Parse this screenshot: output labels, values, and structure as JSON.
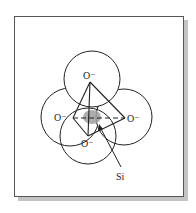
{
  "figure": {
    "frame": {
      "x": 14,
      "y": 16,
      "width": 169,
      "height": 180,
      "shadow_color": "#c4c4c4",
      "border_color": "#555555"
    },
    "atom_color": "#9e9e9e",
    "line_color": "#222222",
    "oxygen_atoms": [
      {
        "id": "top",
        "label": "O⁻",
        "cx": 92,
        "cy": 79,
        "r": 28,
        "vertex": [
          90,
          82
        ],
        "label_pos": [
          83,
          79
        ]
      },
      {
        "id": "left",
        "label": "O⁻",
        "cx": 70,
        "cy": 117,
        "r": 29,
        "vertex": [
          73,
          118
        ],
        "label_pos": [
          54,
          121
        ]
      },
      {
        "id": "right",
        "label": "O⁻",
        "cx": 124,
        "cy": 117,
        "r": 28,
        "vertex": [
          125,
          118
        ],
        "label_pos": [
          127,
          122
        ]
      },
      {
        "id": "bottom",
        "label": "O⁻",
        "cx": 88,
        "cy": 136,
        "r": 28,
        "vertex": [
          88,
          136
        ],
        "label_pos": [
          81,
          147
        ]
      }
    ],
    "silicon": {
      "label": "Si",
      "cx": 92,
      "cy": 117,
      "rx": 9,
      "ry": 7,
      "label_pos": [
        116,
        180
      ]
    },
    "leader": {
      "x1": 121,
      "y1": 167,
      "x2": 100,
      "y2": 126
    }
  }
}
